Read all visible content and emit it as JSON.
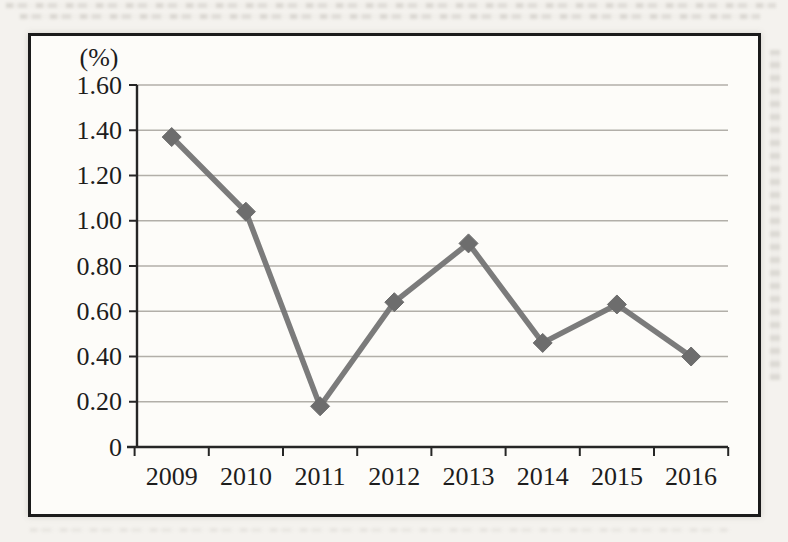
{
  "page": {
    "paper_color": "#f4f2ee",
    "frame_border_color": "#1b1b1b",
    "chart_background": "#fdfcf9"
  },
  "chart_data": {
    "type": "line",
    "title": "",
    "xlabel": "",
    "ylabel": "(%)",
    "categories": [
      "2009",
      "2010",
      "2011",
      "2012",
      "2013",
      "2014",
      "2015",
      "2016"
    ],
    "series": [
      {
        "name": "percentage",
        "values": [
          1.37,
          1.04,
          0.18,
          0.64,
          0.9,
          0.46,
          0.63,
          0.4
        ]
      }
    ],
    "ylim": [
      0,
      1.6
    ],
    "ytick_step": 0.2,
    "ytick_labels": [
      "0",
      "0.20",
      "0.40",
      "0.60",
      "0.80",
      "1.00",
      "1.20",
      "1.40",
      "1.60"
    ],
    "grid": true,
    "legend": false,
    "marker": "diamond",
    "line_color": "#747474",
    "marker_color": "#6d6d6d",
    "grid_color": "#b2afa9",
    "axis_color": "#262626",
    "text_color": "#1d1d1d"
  }
}
